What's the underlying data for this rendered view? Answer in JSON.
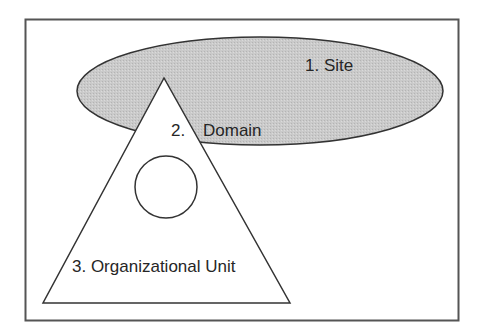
{
  "diagram": {
    "title": "",
    "colors": {
      "background": "#ffffff",
      "frame_stroke": "#555555",
      "shape_stroke": "#333333",
      "site_fill": "#c4c4c4",
      "text": "#262626"
    },
    "labels": {
      "site": "1. Site",
      "domain_number": "2.",
      "domain_name": "Domain",
      "ou": "3. Organizational Unit"
    },
    "shapes": [
      {
        "id": "site",
        "type": "ellipse",
        "label": "1. Site"
      },
      {
        "id": "domain",
        "type": "triangle",
        "label": "2. Domain"
      },
      {
        "id": "ou",
        "type": "circle",
        "label": "3. Organizational Unit"
      }
    ]
  }
}
